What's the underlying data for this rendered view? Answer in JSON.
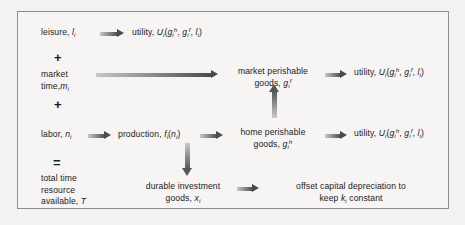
{
  "diagram": {
    "border_color": "#8e8e8e",
    "background_color": "#f6f5f3",
    "arrow_color": "#4a4a4a",
    "operators": {
      "plus_1": "+",
      "plus_2": "+",
      "equals": "="
    },
    "nodes": {
      "leisure": {
        "label": "leisure,",
        "var": "l",
        "sub": "i"
      },
      "utility_top": {
        "label": "utility,",
        "fn": "U",
        "fn_sub": "i",
        "args": [
          "g",
          "g",
          "l"
        ],
        "arg1_sub": "i",
        "arg1_sup": "h",
        "arg2_sub": "i",
        "arg2_sup": "f",
        "arg3_sub": "i"
      },
      "market_time": {
        "line1": "market",
        "line2": "time,",
        "var": "m",
        "sub": "i"
      },
      "market_perishable": {
        "line1": "market perishable",
        "line2": "goods,",
        "var": "g",
        "sub": "i",
        "sup": "f"
      },
      "utility_middle": {
        "label": "utility,",
        "fn": "U",
        "fn_sub": "i",
        "arg1_sub": "i",
        "arg1_sup": "h",
        "arg2_sub": "i",
        "arg2_sup": "f",
        "arg3_sub": "i"
      },
      "labor": {
        "label": "labor,",
        "var": "n",
        "sub": "i"
      },
      "production": {
        "label": "production,",
        "fn": "f",
        "fn_sub": "i",
        "arg": "n",
        "arg_sub": "i"
      },
      "home_perishable": {
        "line1": "home perishable",
        "line2": "goods,",
        "var": "g",
        "sub": "i",
        "sup": "h"
      },
      "utility_bottom": {
        "label": "utility,",
        "fn": "U",
        "fn_sub": "i",
        "arg1_sub": "i",
        "arg1_sup": "h",
        "arg2_sub": "i",
        "arg2_sup": "f",
        "arg3_sub": "i"
      },
      "total_time": {
        "line1": "total time",
        "line2": "resource",
        "line3": "available,",
        "var": "T"
      },
      "durable_investment": {
        "line1": "durable investment",
        "line2": "goods,",
        "var": "x",
        "sub": "i"
      },
      "offset_depreciation": {
        "line1": "offset capital depreciation to",
        "line2a": "keep",
        "var": "k",
        "sub": "i",
        "line2b": "constant"
      }
    }
  }
}
